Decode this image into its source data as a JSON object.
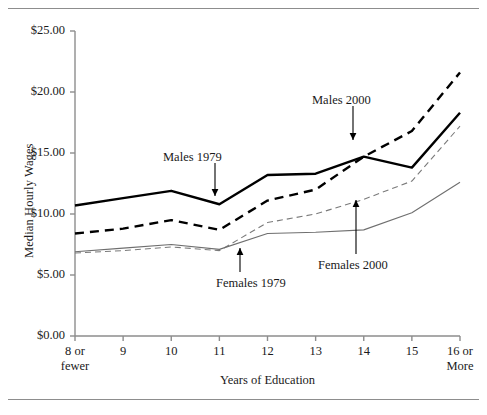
{
  "chart_data": {
    "type": "line",
    "title": "",
    "xlabel": "Years of Education",
    "ylabel": "Median Hourly Wages",
    "categories": [
      "8 or fewer",
      "9",
      "10",
      "11",
      "12",
      "13",
      "14",
      "15",
      "16 or More"
    ],
    "x_tick_labels": [
      {
        "line1": "8 or",
        "line2": "fewer"
      },
      {
        "line1": "9",
        "line2": ""
      },
      {
        "line1": "10",
        "line2": ""
      },
      {
        "line1": "11",
        "line2": ""
      },
      {
        "line1": "12",
        "line2": ""
      },
      {
        "line1": "13",
        "line2": ""
      },
      {
        "line1": "14",
        "line2": ""
      },
      {
        "line1": "15",
        "line2": ""
      },
      {
        "line1": "16 or",
        "line2": "More"
      }
    ],
    "y_tick_labels": [
      "$25.00",
      "$20.00",
      "$15.00",
      "$10.00",
      "$5.00",
      "$0.00"
    ],
    "y_tick_values": [
      25,
      20,
      15,
      10,
      5,
      0
    ],
    "ylim": [
      0,
      25
    ],
    "grid": false,
    "legend": "annotations",
    "series": [
      {
        "name": "Males 1979",
        "style": "thick-solid",
        "color": "#000000",
        "values": [
          10.7,
          11.3,
          11.9,
          10.8,
          13.2,
          13.3,
          14.7,
          13.8,
          18.3
        ]
      },
      {
        "name": "Males 2000",
        "style": "thick-dashed",
        "color": "#000000",
        "values": [
          8.4,
          8.8,
          9.5,
          8.7,
          11.1,
          12.0,
          14.7,
          16.8,
          21.6
        ]
      },
      {
        "name": "Females 1979",
        "style": "thin-dashed",
        "color": "#7a7a7a",
        "values": [
          6.8,
          7.0,
          7.3,
          7.0,
          9.3,
          10.0,
          11.2,
          12.7,
          17.2
        ]
      },
      {
        "name": "Females 2000",
        "style": "thin-solid",
        "color": "#6f6f6f",
        "values": [
          6.9,
          7.2,
          7.5,
          7.1,
          8.4,
          8.5,
          8.7,
          10.1,
          12.6
        ]
      }
    ],
    "annotations": [
      {
        "label": "Males 1979",
        "target_series": "Males 1979",
        "at_category": "11"
      },
      {
        "label": "Males 2000",
        "target_series": "Males 2000",
        "at_category": "14"
      },
      {
        "label": "Females 1979",
        "target_series": "Females 1979",
        "at_category": "11"
      },
      {
        "label": "Females 2000",
        "target_series": "Females 2000",
        "at_category": "14"
      }
    ]
  }
}
